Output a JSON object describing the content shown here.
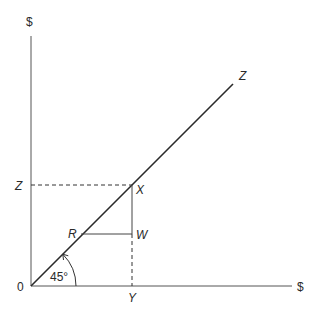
{
  "diagram": {
    "y_axis_label": "$",
    "x_axis_label": "$",
    "origin_label": "0",
    "line_label": "Z",
    "z_level_label": "Z",
    "point_x_label": "X",
    "point_r_label": "R",
    "point_w_label": "W",
    "y_value_label": "Y",
    "angle_label": "45°",
    "colors": {
      "line": "#2a2a2a",
      "axis": "#555555",
      "background": "#ffffff"
    }
  }
}
